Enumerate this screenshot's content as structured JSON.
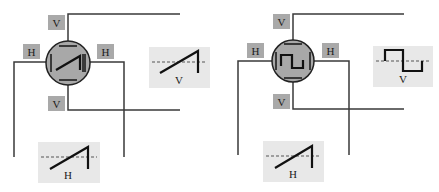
{
  "colors": {
    "tube_fill": "#a8a8a8",
    "label_box": "#a9a9a9",
    "panel_fill": "#e8e8e8",
    "line": "#3a3a3a"
  },
  "diagrams": [
    {
      "name": "sawtooth-display",
      "screen_trace": "diagonal-line",
      "labels": {
        "v_top": "V",
        "v_bottom": "V",
        "h_left": "H",
        "h_right": "H"
      },
      "v_signal": {
        "label": "V",
        "waveform": "sawtooth"
      },
      "h_signal": {
        "label": "H",
        "waveform": "sawtooth"
      }
    },
    {
      "name": "square-wave-display",
      "screen_trace": "square-wave",
      "labels": {
        "v_top": "V",
        "v_bottom": "V",
        "h_left": "H",
        "h_right": "H"
      },
      "v_signal": {
        "label": "V",
        "waveform": "square"
      },
      "h_signal": {
        "label": "H",
        "waveform": "sawtooth"
      }
    }
  ]
}
